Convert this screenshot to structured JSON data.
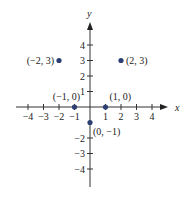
{
  "chart_data": {
    "type": "scatter",
    "title": "",
    "xlabel": "x",
    "ylabel": "y",
    "xlim": [
      -4.5,
      5
    ],
    "ylim": [
      -5,
      5
    ],
    "grid": false,
    "x_ticks": [
      -4,
      -3,
      -2,
      -1,
      1,
      2,
      3,
      4
    ],
    "y_ticks": [
      -4,
      -3,
      -2,
      1,
      2,
      3,
      4
    ],
    "x_tick_labels": [
      "−4",
      "−3",
      "−2",
      "−1",
      "1",
      "2",
      "3",
      "4"
    ],
    "y_tick_labels": [
      "−4",
      "−3",
      "−2",
      "1",
      "2",
      "3",
      "4"
    ],
    "points": [
      {
        "x": -2,
        "y": 3,
        "label": "(−2, 3)"
      },
      {
        "x": 2,
        "y": 3,
        "label": "(2, 3)"
      },
      {
        "x": -1,
        "y": 0,
        "label": "(−1, 0)"
      },
      {
        "x": 1,
        "y": 0,
        "label": "(1, 0)"
      },
      {
        "x": 0,
        "y": -1,
        "label": "(0, −1)"
      }
    ],
    "point_color": "#2b3f73"
  }
}
